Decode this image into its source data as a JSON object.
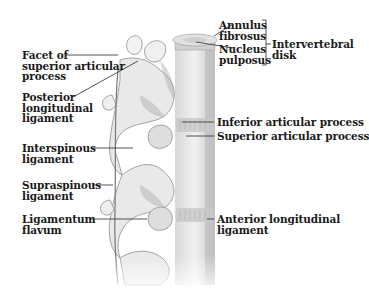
{
  "figure": {
    "colors": {
      "bone_fill": "#ececec",
      "bone_shade": "#b8b8b8",
      "line": "#333333",
      "text": "#1a1a1a",
      "background": "#ffffff"
    }
  },
  "labels": {
    "facet": {
      "line1": "Facet of",
      "line2": "superior articular",
      "line3": "process"
    },
    "posterior": {
      "line1": "Posterior",
      "line2": "longitudinal",
      "line3": "ligament"
    },
    "interspinous": {
      "line1": "Interspinous",
      "line2": "ligament"
    },
    "supraspinous": {
      "line1": "Supraspinous",
      "line2": "ligament"
    },
    "flavum": {
      "line1": "Ligamentum",
      "line2": "flavum"
    },
    "annulus": {
      "line1": "Annulus",
      "line2": "fibrosus"
    },
    "nucleus": {
      "line1": "Nucleus",
      "line2": "pulposus"
    },
    "disk": {
      "line1": "Intervertebral",
      "line2": "disk"
    },
    "inferior": {
      "line1": "Inferior articular process"
    },
    "superior": {
      "line1": "Superior articular process"
    },
    "anterior": {
      "line1": "Anterior longitudinal",
      "line2": "ligament"
    }
  }
}
